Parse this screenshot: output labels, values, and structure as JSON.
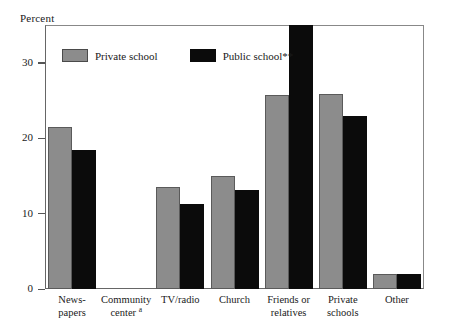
{
  "chart_data": {
    "type": "bar",
    "title": "",
    "subtitle": "",
    "xlabel": "",
    "ylabel": "Percent",
    "ylim": [
      0,
      35
    ],
    "yticks": [
      0,
      10,
      20,
      30
    ],
    "ytick_labels": [
      "0",
      "10",
      "20",
      "30"
    ],
    "grid": false,
    "legend_position": "top-left-inside",
    "note_markers": [
      "a",
      "**"
    ],
    "categories": [
      "News-\npapers",
      "Community\ncenter",
      "TV/radio",
      "Church",
      "Friends or\nrelatives",
      "Private\nschools",
      "Other"
    ],
    "category_superscripts": [
      "",
      "a",
      "",
      "",
      "",
      "",
      ""
    ],
    "series": [
      {
        "name": "Private school",
        "color": "#8c8c8c",
        "values": [
          21.5,
          null,
          13.5,
          15.0,
          25.7,
          25.8,
          2.0
        ]
      },
      {
        "name": "Public school**",
        "color": "#0b0b0b",
        "values": [
          18.4,
          null,
          11.3,
          13.1,
          35.0,
          22.9,
          2.0
        ]
      }
    ]
  },
  "legend": {
    "entries": [
      {
        "label": "Private school",
        "swatch": "private-school-swatch"
      },
      {
        "label": "Public school**",
        "swatch": "public-school-swatch"
      }
    ]
  },
  "axis": {
    "y_title": "Percent"
  }
}
